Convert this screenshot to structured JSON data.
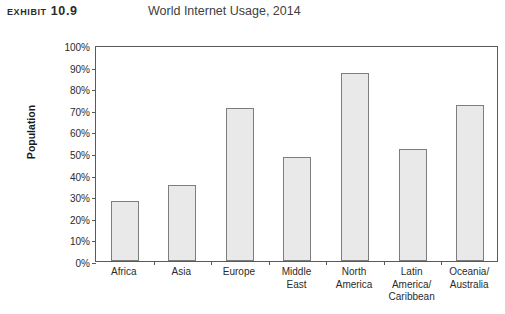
{
  "header": {
    "exhibit_tag": "Exhibit 10.9",
    "title": "World Internet Usage, 2014"
  },
  "chart_data": {
    "type": "bar",
    "title": "World Internet Usage, 2014",
    "xlabel": "",
    "ylabel": "Population",
    "ylim": [
      0,
      100
    ],
    "y_unit": "%",
    "grid": false,
    "legend": null,
    "y_ticks": [
      "0%",
      "10%",
      "20%",
      "30%",
      "40%",
      "50%",
      "60%",
      "70%",
      "80%",
      "90%",
      "100%"
    ],
    "y_tick_values": [
      0,
      10,
      20,
      30,
      40,
      50,
      60,
      70,
      80,
      90,
      100
    ],
    "categories": [
      "Africa",
      "Asia",
      "Europe",
      "Middle East",
      "North America",
      "Latin America/Caribbean",
      "Oceania/Australia"
    ],
    "category_lines": [
      [
        "Africa"
      ],
      [
        "Asia"
      ],
      [
        "Europe"
      ],
      [
        "Middle",
        "East"
      ],
      [
        "North",
        "America"
      ],
      [
        "Latin",
        "America/",
        "Caribbean"
      ],
      [
        "Oceania/",
        "Australia"
      ]
    ],
    "values": [
      28,
      35,
      71,
      48,
      87,
      52,
      72
    ],
    "colors": {
      "bar_fill": "#e9e9e9",
      "bar_border": "#7d7d7d",
      "axis": "#5a5a5a",
      "text": "#2b2b2b",
      "background": "#ffffff"
    }
  }
}
